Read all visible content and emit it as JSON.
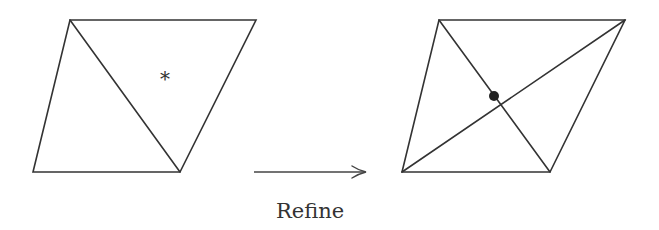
{
  "diagram": {
    "type": "mesh-refinement",
    "colors": {
      "stroke": "#333333",
      "dot": "#222222",
      "background": "#ffffff"
    },
    "before": {
      "label": "original-mesh",
      "vertices": {
        "top_left": [
          70,
          20
        ],
        "top_right": [
          256,
          20
        ],
        "bottom_right": [
          180,
          172
        ],
        "bottom_left": [
          33,
          172
        ]
      },
      "diagonal": [
        [
          70,
          20
        ],
        [
          180,
          172
        ]
      ],
      "marker": {
        "symbol": "*",
        "position": [
          165,
          74
        ]
      }
    },
    "arrow": {
      "from": [
        254,
        172
      ],
      "to": [
        366,
        172
      ],
      "label": "Refine"
    },
    "after": {
      "label": "refined-mesh",
      "vertices": {
        "top_left": [
          439,
          20
        ],
        "top_right": [
          625,
          20
        ],
        "bottom_right": [
          550,
          172
        ],
        "bottom_left": [
          402,
          172
        ]
      },
      "diagonals": [
        [
          [
            439,
            20
          ],
          [
            550,
            172
          ]
        ],
        [
          [
            625,
            20
          ],
          [
            402,
            172
          ]
        ]
      ],
      "new_vertex": [
        494,
        96
      ]
    }
  }
}
